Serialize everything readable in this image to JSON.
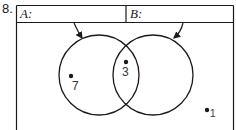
{
  "problem": {
    "number": "8."
  },
  "header": {
    "set_a_label": "A:",
    "set_b_label": "B:",
    "set_a_value": "",
    "set_b_value": ""
  },
  "diagram": {
    "type": "venn",
    "sets": [
      "A",
      "B"
    ],
    "elements": [
      {
        "label": "7",
        "region": "A only"
      },
      {
        "label": "3",
        "region": "A and B"
      },
      {
        "label": "1",
        "region": "outside"
      }
    ]
  },
  "colors": {
    "stroke": "#1a1a1a",
    "background": "#ffffff"
  }
}
